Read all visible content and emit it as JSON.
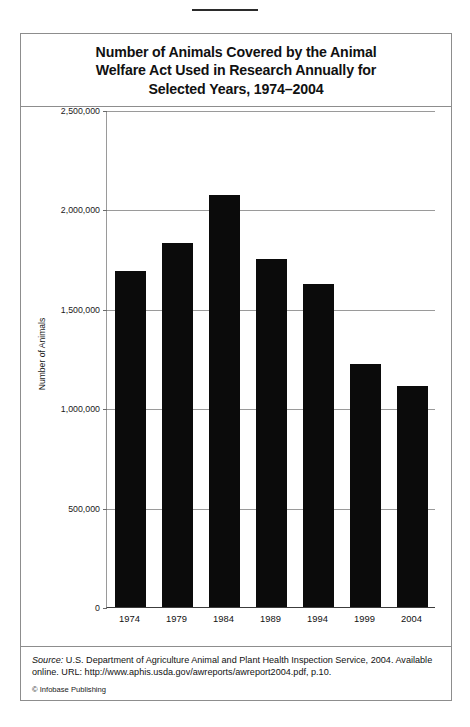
{
  "figure": {
    "title": "Number of Animals Covered by the Animal\nWelfare Act Used in Research Annually for\nSelected Years, 1974–2004",
    "source_label": "Source:",
    "source_body": " U.S. Department of Agriculture Animal and Plant Health Inspection Service, 2004. Available online. URL: http://www.aphis.usda.gov/awreports/awreport2004.pdf, p.10.",
    "copyright": "© Infobase Publishing"
  },
  "chart_data": {
    "type": "bar",
    "title": "Number of Animals Covered by the Animal Welfare Act Used in Research Annually for Selected Years, 1974–2004",
    "xlabel": "",
    "ylabel": "Number of Animals",
    "categories": [
      "1974",
      "1979",
      "1984",
      "1989",
      "1994",
      "1999",
      "2004"
    ],
    "values": [
      1690000,
      1830000,
      2075000,
      1750000,
      1625000,
      1220000,
      1110000
    ],
    "ylim": [
      0,
      2500000
    ],
    "ytick_values": [
      0,
      500000,
      1000000,
      1500000,
      2000000,
      2500000
    ],
    "ytick_labels": [
      "0",
      "500,000",
      "1,000,000",
      "1,500,000",
      "2,000,000",
      "2,500,000"
    ],
    "grid": true,
    "legend": false,
    "bar_color": "#0b0b0b"
  }
}
